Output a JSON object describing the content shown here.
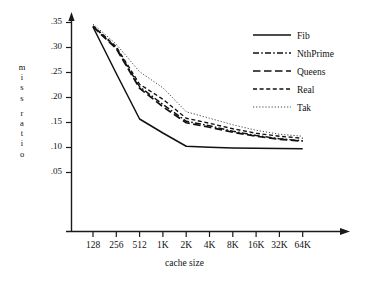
{
  "chart_data": {
    "type": "line",
    "title": "",
    "xlabel": "cache size",
    "ylabel": "miss ratio",
    "ylabel_lines": [
      "m",
      "i",
      "s",
      "s",
      "r",
      "a",
      "t",
      "i",
      "o"
    ],
    "categories": [
      "128",
      "256",
      "512",
      "1K",
      "2K",
      "4K",
      "8K",
      "16K",
      "32K",
      "64K"
    ],
    "x_tick_labels": [
      "128",
      "256",
      "512",
      "1K",
      "2K",
      "4K",
      "8K",
      "16K",
      "32K",
      "64K"
    ],
    "y_tick_labels": [
      ".35",
      ".30",
      ".25",
      ".20",
      ".15",
      ".10",
      ".05"
    ],
    "y_tick_values": [
      0.35,
      0.3,
      0.25,
      0.2,
      0.15,
      0.1,
      0.05
    ],
    "ylim": [
      0.0,
      0.365
    ],
    "grid": false,
    "legend_position": "top-right",
    "axis_color": "#1a1a1a",
    "series": [
      {
        "name": "Fib",
        "style": "solid",
        "color": "#111111",
        "values": [
          0.341,
          0.248,
          0.157,
          0.129,
          0.1025,
          0.1005,
          0.099,
          0.0985,
          0.098,
          0.0975
        ]
      },
      {
        "name": "NthPrime",
        "style": "dash-dot",
        "color": "#111111",
        "values": [
          0.3425,
          0.299,
          0.2215,
          0.186,
          0.1525,
          0.1435,
          0.1325,
          0.124,
          0.1175,
          0.1135
        ]
      },
      {
        "name": "Queens",
        "style": "long-dash",
        "color": "#111111",
        "values": [
          0.3415,
          0.2975,
          0.2185,
          0.1815,
          0.1495,
          0.1405,
          0.1305,
          0.1225,
          0.1165,
          0.1125
        ]
      },
      {
        "name": "Real",
        "style": "dashed",
        "color": "#111111",
        "values": [
          0.3435,
          0.3015,
          0.2265,
          0.1965,
          0.1585,
          0.1485,
          0.1375,
          0.1285,
          0.1225,
          0.1185
        ]
      },
      {
        "name": "Tak",
        "style": "dotted",
        "color": "#444444",
        "values": [
          0.347,
          0.3065,
          0.2515,
          0.2195,
          0.1715,
          0.1585,
          0.1455,
          0.1345,
          0.1265,
          0.1225
        ]
      }
    ]
  },
  "legend": {
    "entries": [
      {
        "label": "Fib",
        "style": "solid"
      },
      {
        "label": "NthPrime",
        "style": "dash-dot"
      },
      {
        "label": "Queens",
        "style": "long-dash"
      },
      {
        "label": "Real",
        "style": "dashed"
      },
      {
        "label": "Tak",
        "style": "dotted"
      }
    ]
  }
}
